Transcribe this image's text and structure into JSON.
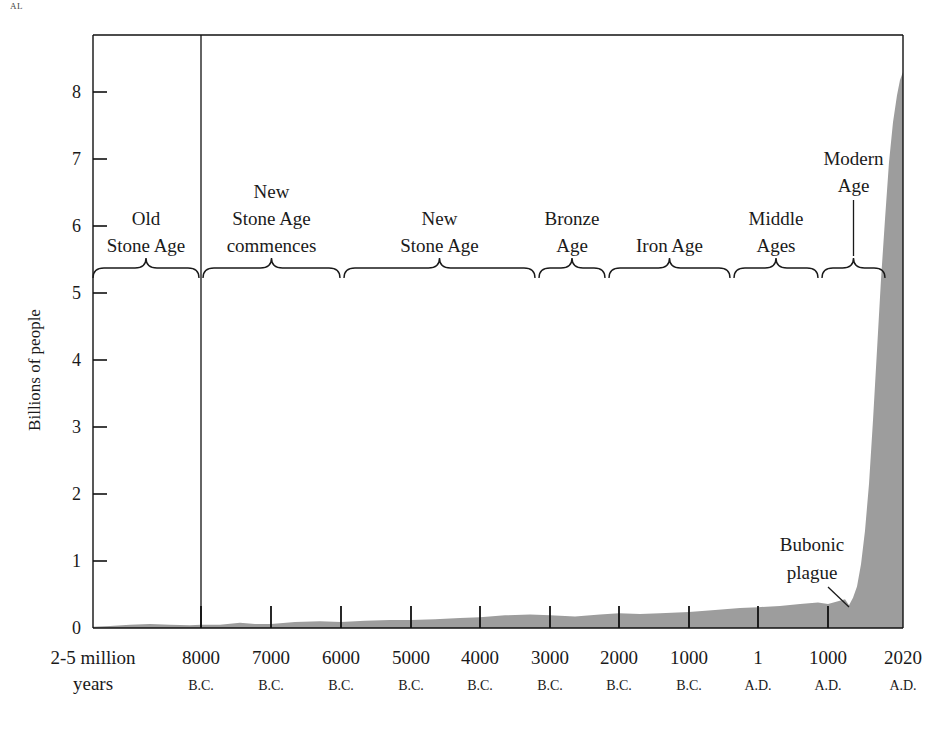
{
  "page": {
    "corner_fragment": "AL",
    "background": "#ffffff",
    "ink": "#1a1a1a"
  },
  "chart_data": {
    "type": "area",
    "title": "",
    "subtitle": "",
    "xlabel": "",
    "ylabel": "Billions of people",
    "ylim": [
      0,
      8.6
    ],
    "xlim_labels": [
      "2-5 million years",
      "2020 A.D."
    ],
    "grid": false,
    "legend": "none",
    "area_color": "#9d9d9d",
    "series_name": "World population",
    "y_ticks": [
      0,
      1,
      2,
      3,
      4,
      5,
      6,
      7,
      8
    ],
    "y_tick_labels": [
      "0",
      "1",
      "2",
      "3",
      "4",
      "5",
      "6",
      "7",
      "8"
    ],
    "x_ticks": [
      {
        "year_label": "2-5 million",
        "era_label": "years",
        "x_px": 93,
        "no_tick": true
      },
      {
        "year_label": "8000",
        "era_label": "B.C.",
        "x_px": 201
      },
      {
        "year_label": "7000",
        "era_label": "B.C.",
        "x_px": 271
      },
      {
        "year_label": "6000",
        "era_label": "B.C.",
        "x_px": 341
      },
      {
        "year_label": "5000",
        "era_label": "B.C.",
        "x_px": 411
      },
      {
        "year_label": "4000",
        "era_label": "B.C.",
        "x_px": 480
      },
      {
        "year_label": "3000",
        "era_label": "B.C.",
        "x_px": 550
      },
      {
        "year_label": "2000",
        "era_label": "B.C.",
        "x_px": 619
      },
      {
        "year_label": "1000",
        "era_label": "B.C.",
        "x_px": 689
      },
      {
        "year_label": "1",
        "era_label": "A.D.",
        "x_px": 758
      },
      {
        "year_label": "1000",
        "era_label": "A.D.",
        "x_px": 828
      },
      {
        "year_label": "2020",
        "era_label": "A.D.",
        "x_px": 903,
        "no_tick": true
      }
    ],
    "points": [
      {
        "x_px": 93,
        "value": 0.02
      },
      {
        "x_px": 110,
        "value": 0.03
      },
      {
        "x_px": 130,
        "value": 0.05
      },
      {
        "x_px": 150,
        "value": 0.06
      },
      {
        "x_px": 170,
        "value": 0.05
      },
      {
        "x_px": 190,
        "value": 0.04
      },
      {
        "x_px": 201,
        "value": 0.05
      },
      {
        "x_px": 220,
        "value": 0.05
      },
      {
        "x_px": 240,
        "value": 0.08
      },
      {
        "x_px": 255,
        "value": 0.06
      },
      {
        "x_px": 271,
        "value": 0.06
      },
      {
        "x_px": 295,
        "value": 0.09
      },
      {
        "x_px": 320,
        "value": 0.1
      },
      {
        "x_px": 341,
        "value": 0.09
      },
      {
        "x_px": 365,
        "value": 0.11
      },
      {
        "x_px": 390,
        "value": 0.12
      },
      {
        "x_px": 411,
        "value": 0.12
      },
      {
        "x_px": 435,
        "value": 0.13
      },
      {
        "x_px": 460,
        "value": 0.15
      },
      {
        "x_px": 480,
        "value": 0.16
      },
      {
        "x_px": 505,
        "value": 0.19
      },
      {
        "x_px": 530,
        "value": 0.2
      },
      {
        "x_px": 550,
        "value": 0.19
      },
      {
        "x_px": 575,
        "value": 0.17
      },
      {
        "x_px": 600,
        "value": 0.2
      },
      {
        "x_px": 619,
        "value": 0.22
      },
      {
        "x_px": 640,
        "value": 0.21
      },
      {
        "x_px": 660,
        "value": 0.22
      },
      {
        "x_px": 689,
        "value": 0.24
      },
      {
        "x_px": 715,
        "value": 0.27
      },
      {
        "x_px": 740,
        "value": 0.3
      },
      {
        "x_px": 758,
        "value": 0.31
      },
      {
        "x_px": 780,
        "value": 0.33
      },
      {
        "x_px": 800,
        "value": 0.36
      },
      {
        "x_px": 818,
        "value": 0.38
      },
      {
        "x_px": 828,
        "value": 0.36
      },
      {
        "x_px": 838,
        "value": 0.4
      },
      {
        "x_px": 845,
        "value": 0.43
      },
      {
        "x_px": 849,
        "value": 0.34
      },
      {
        "x_px": 853,
        "value": 0.45
      },
      {
        "x_px": 857,
        "value": 0.62
      },
      {
        "x_px": 861,
        "value": 0.95
      },
      {
        "x_px": 865,
        "value": 1.45
      },
      {
        "x_px": 869,
        "value": 2.15
      },
      {
        "x_px": 873,
        "value": 3.1
      },
      {
        "x_px": 877,
        "value": 4.15
      },
      {
        "x_px": 881,
        "value": 5.2
      },
      {
        "x_px": 885,
        "value": 6.1
      },
      {
        "x_px": 889,
        "value": 6.95
      },
      {
        "x_px": 893,
        "value": 7.55
      },
      {
        "x_px": 897,
        "value": 7.95
      },
      {
        "x_px": 900,
        "value": 8.18
      },
      {
        "x_px": 903,
        "value": 8.3
      }
    ]
  },
  "plot": {
    "left_px": 93,
    "right_px": 903,
    "top_px": 35,
    "baseline_px": 628,
    "y_unit_px": 67,
    "divider_x_px": 201
  },
  "eras": [
    {
      "id": "old-stone-age",
      "lines": [
        "Old",
        "Stone Age"
      ],
      "start_px": 93,
      "end_px": 199
    },
    {
      "id": "new-stone-age-commences",
      "lines": [
        "New",
        "Stone Age",
        "commences"
      ],
      "start_px": 203,
      "end_px": 340
    },
    {
      "id": "new-stone-age",
      "lines": [
        "New",
        "Stone Age"
      ],
      "start_px": 344,
      "end_px": 535
    },
    {
      "id": "bronze-age",
      "lines": [
        "Bronze",
        "Age"
      ],
      "start_px": 539,
      "end_px": 605
    },
    {
      "id": "iron-age",
      "lines": [
        "Iron Age"
      ],
      "start_px": 609,
      "end_px": 730
    },
    {
      "id": "middle-ages",
      "lines": [
        "Middle",
        "Ages"
      ],
      "start_px": 734,
      "end_px": 818
    },
    {
      "id": "modern-age",
      "lines": [
        "Modern",
        "Age"
      ],
      "start_px": 822,
      "end_px": 885,
      "label_offset_y": -60,
      "leader": true
    }
  ],
  "annotations": [
    {
      "id": "bubonic-plague",
      "lines": [
        "Bubonic",
        "plague"
      ],
      "label_x_px": 812,
      "label_y_px": 551,
      "leader": {
        "x1": 828,
        "y1": 587,
        "x2": 849,
        "y2": 607
      }
    }
  ]
}
